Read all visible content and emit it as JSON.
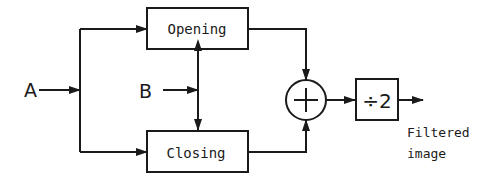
{
  "diagram": {
    "inputs": {
      "a_label": "A",
      "b_label": "B"
    },
    "blocks": {
      "opening_label": "Opening",
      "closing_label": "Closing",
      "sum_symbol": "+",
      "divide_label": "÷2"
    },
    "output": {
      "line1": "Filtered",
      "line2": "image"
    },
    "colors": {
      "stroke": "#1a1a1a",
      "background": "#ffffff"
    }
  }
}
